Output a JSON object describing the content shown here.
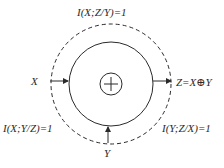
{
  "diagram": {
    "type": "xor-mutual-information",
    "center_symbol": "⊕",
    "labels": {
      "top": "I(X;Z/Y)=1",
      "left_input": "X",
      "bottom_input": "Y",
      "output": "Z=X⊕Y",
      "bottom_left": "I(X;Y/Z)=1",
      "bottom_right": "I(Y;Z/X)=1"
    },
    "colors": {
      "stroke": "#2a2a2a",
      "background": "#ffffff"
    }
  }
}
